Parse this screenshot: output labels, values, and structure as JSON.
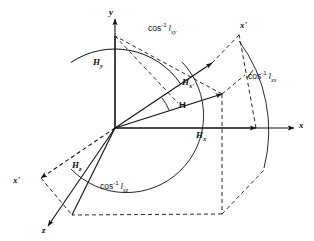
{
  "figure": {
    "name": "direction-cosines-vector-decomposition",
    "background_color": "#ffffff",
    "line_color": "#111111"
  },
  "axes": [
    {
      "id": "y",
      "label": "y",
      "italic": true
    },
    {
      "id": "x",
      "label": "x",
      "italic": true
    },
    {
      "id": "z",
      "label": "z",
      "italic": true
    },
    {
      "id": "x-prime-upper",
      "label": "x'",
      "italic": true
    },
    {
      "id": "x-prime-lower",
      "label": "x'",
      "italic": true
    }
  ],
  "components": [
    {
      "id": "Hy",
      "base": "H",
      "sub": "y"
    },
    {
      "id": "Hx",
      "base": "H",
      "sub": "x"
    },
    {
      "id": "Hz",
      "base": "H",
      "sub": "z"
    },
    {
      "id": "Hxprime",
      "base": "H",
      "sub": "x'"
    }
  ],
  "vector": {
    "id": "H",
    "label": "H"
  },
  "angles": [
    {
      "id": "angle-xy",
      "fn": "cos",
      "sup": "-1",
      "symbol": "l",
      "sub": "xy"
    },
    {
      "id": "angle-xx",
      "fn": "cos",
      "sup": "-1",
      "symbol": "l",
      "sub": "xx"
    },
    {
      "id": "angle-xz",
      "fn": "cos",
      "sup": "-1",
      "symbol": "l",
      "sub": "xz"
    }
  ]
}
